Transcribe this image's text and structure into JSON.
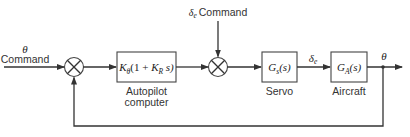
{
  "diagram": {
    "type": "block-diagram",
    "inputs": {
      "theta_command": {
        "symbol": "θ",
        "label": "Command"
      },
      "delta_e_command": {
        "symbol": "δ",
        "subscript": "e",
        "label": "Command"
      }
    },
    "blocks": [
      {
        "id": "autopilot",
        "tf_main": "K",
        "tf_sub": "θ",
        "tf_rest": "(1 + ",
        "tf_K2": "K",
        "tf_sub2": "R",
        "tf_end": " s)",
        "caption_line1": "Autopilot",
        "caption_line2": "computer"
      },
      {
        "id": "servo",
        "tf_main": "G",
        "tf_sub": "s",
        "tf_end": "(s)",
        "caption": "Servo"
      },
      {
        "id": "aircraft",
        "tf_main": "G",
        "tf_sub": "A",
        "tf_end": "(s)",
        "caption": "Aircraft"
      }
    ],
    "signals": {
      "servo_output": {
        "symbol": "δ",
        "subscript": "e"
      },
      "output": {
        "symbol": "θ"
      }
    },
    "summing_junctions": [
      {
        "id": "sum1",
        "inputs": [
          "θ command",
          "feedback θ"
        ]
      },
      {
        "id": "sum2",
        "inputs": [
          "autopilot output",
          "δe command"
        ]
      }
    ],
    "feedback": "unity feedback from θ output to first summing junction"
  }
}
